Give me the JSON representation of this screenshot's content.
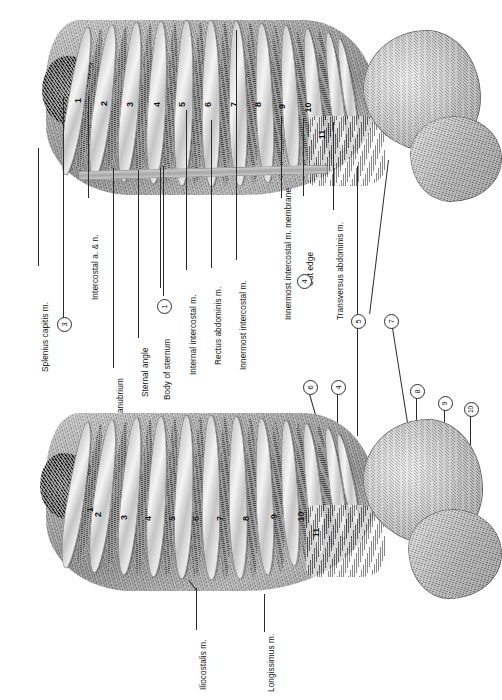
{
  "figure": {
    "background_color": "#ffffff",
    "ink_color": "#2b2b2b",
    "orientation": "labels rotated 90 degrees counter-clockwise"
  },
  "labels": {
    "splenius_capitis": "Splenius capitis m.",
    "intercostal_a_n": "Intercostal a. & n.",
    "manubrium": "Manubrium",
    "sternal_angle": "Sternal angle",
    "body_of_sternum": "Body of sternum",
    "internal_intercostal": "Internal intercostal m.",
    "rectus_abdominis": "Rectus abdominis m.",
    "innermost_intercostal": "Innermost intercostal m.",
    "innermost_intercostal_membrane": "Innermost intercostal m. membrane",
    "cut_edge": "Cut edge",
    "transversus_abdominis": "Transversus abdominis m.",
    "iliocostalis": "Iliocostalis m.",
    "longissimus": "Longissimus m."
  },
  "circled_numbers": [
    {
      "id": "c3",
      "value": "3"
    },
    {
      "id": "c1",
      "value": "1"
    },
    {
      "id": "c4a",
      "value": "4"
    },
    {
      "id": "c5",
      "value": "5"
    },
    {
      "id": "c7",
      "value": "7"
    },
    {
      "id": "c6",
      "value": "6"
    },
    {
      "id": "c4b",
      "value": "4"
    },
    {
      "id": "c8",
      "value": "8"
    },
    {
      "id": "c9",
      "value": "9"
    },
    {
      "id": "c10",
      "value": "10"
    }
  ],
  "upper_figure": {
    "name": "upper thoracic wall view",
    "rib_numbers": [
      "1",
      "2",
      "3",
      "4",
      "5",
      "6",
      "7",
      "8",
      "9",
      "10",
      "11"
    ]
  },
  "lower_figure": {
    "name": "lower thoracic wall view",
    "rib_numbers": [
      "1",
      "2",
      "3",
      "4",
      "5",
      "6",
      "7",
      "8",
      "9",
      "10",
      "11"
    ]
  }
}
